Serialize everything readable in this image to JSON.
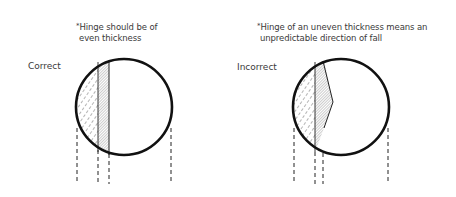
{
  "panels": [
    {
      "id": "correct",
      "label": "Correct",
      "note_marker": "*",
      "note_line1": "Hinge should be of",
      "note_line2": "even thickness"
    },
    {
      "id": "incorrect",
      "label": "Incorrect",
      "note_marker": "*",
      "note_line1": "Hinge of an uneven thickness means an",
      "note_line2": "unpredictable direction of fall"
    }
  ],
  "colors": {
    "outline": "#111111",
    "text": "#3a3a3a",
    "hatch": "#555555"
  }
}
